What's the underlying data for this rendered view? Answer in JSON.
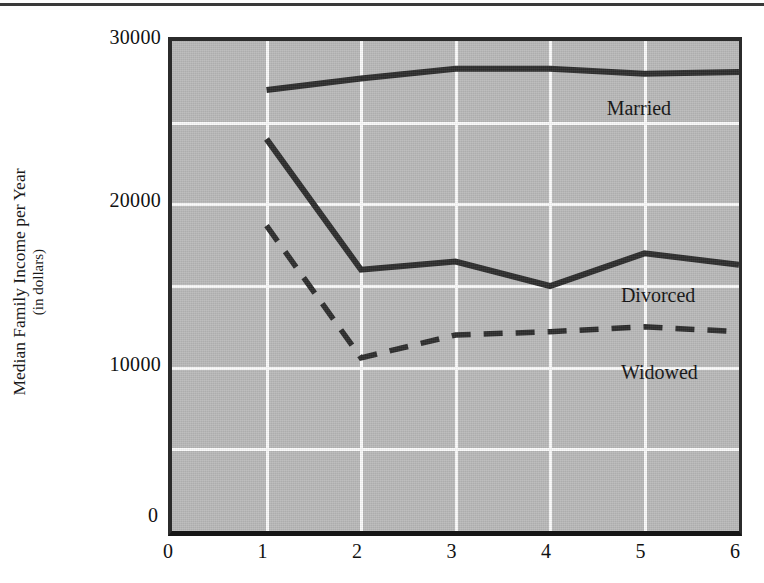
{
  "chart_data": {
    "type": "line",
    "title": "",
    "xlabel": "",
    "ylabel": "Median Family Income per Year (in dollars)",
    "ylabel_line1": "Median Family Income per Year",
    "ylabel_line2": "(in dollars)",
    "x": [
      1,
      2,
      3,
      4,
      5,
      6
    ],
    "xlim": [
      0,
      6
    ],
    "ylim": [
      0,
      30000
    ],
    "xticks": [
      "0",
      "1",
      "2",
      "3",
      "4",
      "5",
      "6"
    ],
    "xtick_values": [
      0,
      1,
      2,
      3,
      4,
      5,
      6
    ],
    "yticks": [
      "0",
      "10000",
      "20000",
      "30000"
    ],
    "ytick_values": [
      0,
      10000,
      20000,
      30000
    ],
    "gridlines_y": [
      5000,
      10000,
      15000,
      20000,
      25000
    ],
    "gridlines_x": [
      1,
      2,
      3,
      4,
      5
    ],
    "grid": true,
    "legend_position": "inline-annotations",
    "plot_background": "#b9b9b9",
    "gridline_color": "#fbfbfb",
    "line_color": "#2b2b2b",
    "series": [
      {
        "name": "Married",
        "style": "solid",
        "values": [
          27000,
          27700,
          28300,
          28300,
          28000,
          28100
        ]
      },
      {
        "name": "Divorced",
        "style": "solid",
        "values": [
          24000,
          16000,
          16500,
          15000,
          17000,
          16300
        ]
      },
      {
        "name": "Widowed",
        "style": "dashed",
        "values": [
          18700,
          10600,
          12000,
          12200,
          12500,
          12200
        ]
      }
    ],
    "annotations": [
      {
        "text": "Married",
        "x": 4.6,
        "y": 25800
      },
      {
        "text": "Divorced",
        "x": 4.75,
        "y": 14300
      },
      {
        "text": "Widowed",
        "x": 4.75,
        "y": 9600
      }
    ]
  }
}
